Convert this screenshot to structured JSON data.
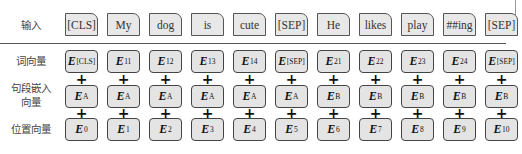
{
  "rows": {
    "input": {
      "label": "输入",
      "tokens": [
        "[CLS]",
        "My",
        "dog",
        "is",
        "cute",
        "[SEP]",
        "He",
        "likes",
        "play",
        "##ing",
        "[SEP]"
      ]
    },
    "token_embeddings": {
      "label": "词向量",
      "symbol": "E",
      "subscripts": [
        "[CLS]",
        "11",
        "12",
        "13",
        "14",
        "[SEP]",
        "21",
        "22",
        "23",
        "24",
        "[SEP]"
      ]
    },
    "segment_embeddings": {
      "label_line1": "句段嵌入",
      "label_line2": "向量",
      "symbol": "E",
      "subscripts": [
        "A",
        "A",
        "A",
        "A",
        "A",
        "A",
        "B",
        "B",
        "B",
        "B",
        "B"
      ]
    },
    "position_embeddings": {
      "label": "位置向量",
      "symbol": "E",
      "subscripts": [
        "0",
        "1",
        "2",
        "3",
        "4",
        "5",
        "6",
        "7",
        "8",
        "9",
        "10"
      ]
    }
  },
  "operator": "+",
  "colors": {
    "box_fill": "#e6e6e6",
    "box_border": "#444444",
    "divider": "#555555"
  }
}
